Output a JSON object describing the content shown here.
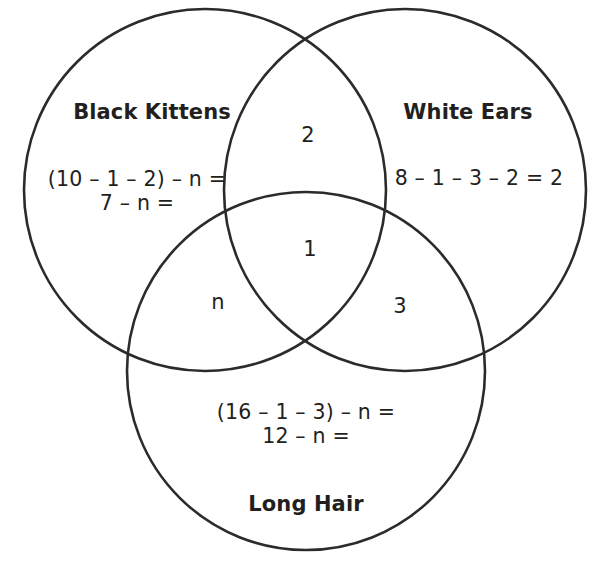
{
  "diagram": {
    "type": "venn-3-set",
    "background_color": "#ffffff",
    "stroke_color": "#2b2b2b",
    "text_color": "#231f20",
    "sets": [
      {
        "id": "black-kittens",
        "title": "Black Kittens",
        "lines": [
          "(10 – 1 – 2) – n =",
          "7 – n ="
        ]
      },
      {
        "id": "white-ears",
        "title": "White Ears",
        "lines": [
          "8 – 1 – 3 – 2 = 2"
        ]
      },
      {
        "id": "long-hair",
        "title": "Long Hair",
        "lines": [
          "(16 – 1 – 3) – n =",
          "12 – n ="
        ]
      }
    ],
    "regions": {
      "black_and_white": "2",
      "all_three": "1",
      "black_and_long": "n",
      "white_and_long": "3"
    }
  }
}
